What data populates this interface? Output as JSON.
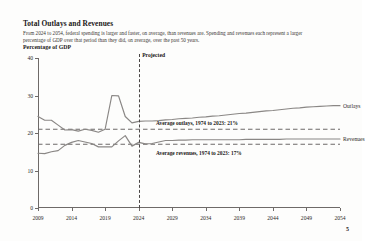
{
  "header": {
    "title": "Total Outlays and Revenues",
    "subtitle": "From 2024 to 2054, federal spending is larger and faster, on average, than revenues are. Spending and revenues each represent a larger percentage of GDP over that period than they did, on average, over the past 50 years.",
    "unit_label": "Percentage of GDP"
  },
  "page_number": "5",
  "chart_data": {
    "type": "line",
    "title": "Total Outlays and Revenues",
    "xlabel": "",
    "ylabel": "Percentage of GDP",
    "xlim": [
      2009,
      2054
    ],
    "ylim": [
      0,
      40
    ],
    "grid": false,
    "legend_position": "right-inline",
    "y_ticks": [
      "0",
      "10",
      "20",
      "30",
      "40"
    ],
    "y_tick_values": [
      0,
      10,
      20,
      30,
      40
    ],
    "x_ticks": [
      "2009",
      "2014",
      "2019",
      "2024",
      "2029",
      "2034",
      "2039",
      "2044",
      "2049",
      "2054"
    ],
    "x_tick_values": [
      2009,
      2014,
      2019,
      2024,
      2029,
      2034,
      2039,
      2044,
      2049,
      2054
    ],
    "x": [
      2009,
      2010,
      2011,
      2012,
      2013,
      2014,
      2015,
      2016,
      2017,
      2018,
      2019,
      2020,
      2021,
      2022,
      2023,
      2024,
      2025,
      2026,
      2027,
      2028,
      2029,
      2030,
      2031,
      2032,
      2033,
      2034,
      2035,
      2036,
      2037,
      2038,
      2039,
      2040,
      2041,
      2042,
      2043,
      2044,
      2045,
      2046,
      2047,
      2048,
      2049,
      2050,
      2051,
      2052,
      2053,
      2054
    ],
    "series": [
      {
        "name": "Outlays",
        "color": "#8a8785",
        "values": [
          24.4,
          23.4,
          23.4,
          22.1,
          20.8,
          20.9,
          20.5,
          21.0,
          20.7,
          20.2,
          21.0,
          30.0,
          29.9,
          24.4,
          22.7,
          23.1,
          23.2,
          23.2,
          23.3,
          23.5,
          23.6,
          23.8,
          23.9,
          24.0,
          24.2,
          24.3,
          24.5,
          24.6,
          24.8,
          25.0,
          25.2,
          25.3,
          25.5,
          25.7,
          25.9,
          26.0,
          26.2,
          26.4,
          26.6,
          26.7,
          26.9,
          27.0,
          27.1,
          27.2,
          27.3,
          27.3
        ]
      },
      {
        "name": "Revenues",
        "color": "#8a8785",
        "values": [
          14.6,
          14.5,
          15.0,
          15.3,
          16.7,
          17.5,
          18.0,
          17.6,
          17.2,
          16.3,
          16.3,
          16.3,
          17.9,
          19.3,
          16.5,
          17.5,
          17.1,
          17.2,
          17.6,
          18.0,
          18.0,
          18.1,
          18.1,
          18.2,
          18.2,
          18.2,
          18.2,
          18.2,
          18.2,
          18.2,
          18.2,
          18.3,
          18.3,
          18.3,
          18.3,
          18.3,
          18.3,
          18.4,
          18.4,
          18.4,
          18.4,
          18.4,
          18.4,
          18.4,
          18.4,
          18.4
        ]
      }
    ],
    "reference_lines": [
      {
        "name": "Average outlays",
        "label": "Average outlays, 1974 to 2023: 21%",
        "value": 21,
        "style": "dashed",
        "color": "#6e6a68"
      },
      {
        "name": "Average revenues",
        "label": "Average revenues, 1974 to 2023: 17%",
        "value": 17,
        "style": "dashed",
        "color": "#6e6a68"
      }
    ],
    "annotations": [
      {
        "name": "projected-divider",
        "label": "Projected",
        "x": 2024,
        "style": "vertical-dashed"
      }
    ]
  }
}
